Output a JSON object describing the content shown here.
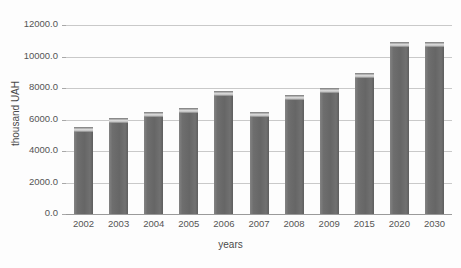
{
  "chart_data": {
    "type": "bar",
    "title": "",
    "subtitle": "",
    "xlabel": "years",
    "ylabel": "thousand UAH",
    "categories": [
      "2002",
      "2003",
      "2004",
      "2005",
      "2006",
      "2007",
      "2008",
      "2009",
      "2015",
      "2020",
      "2030"
    ],
    "values": [
      5550,
      6100,
      6500,
      6750,
      7800,
      6500,
      7550,
      8000,
      8950,
      10950,
      10950
    ],
    "ylim": [
      0,
      12000
    ],
    "ytick_labels": [
      "0.0",
      "2000.0",
      "4000.0",
      "6000.0",
      "8000.0",
      "10000.0",
      "12000.0"
    ],
    "ytick_values": [
      0,
      2000,
      4000,
      6000,
      8000,
      10000,
      12000
    ],
    "grid": true,
    "legend": false,
    "legend_position": "none",
    "series": [
      {
        "name": "thousand UAH",
        "values": [
          5550,
          6100,
          6500,
          6750,
          7800,
          6500,
          7550,
          8000,
          8950,
          10950,
          10950
        ]
      }
    ],
    "colors": {
      "bar_fill": "#6b6b6b",
      "bar_highlight": "#d8d8d8",
      "grid": "#c9c9c9",
      "axis_text": "#555555",
      "background": "#fdfdfd"
    }
  }
}
